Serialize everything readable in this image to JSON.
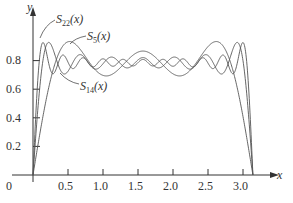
{
  "chart_data": {
    "type": "line",
    "title": "",
    "xlabel": "x",
    "ylabel": "y",
    "xlim": [
      0,
      3.3
    ],
    "ylim": [
      0,
      1.0
    ],
    "grid": false,
    "x_ticks": [
      0.5,
      1.0,
      1.5,
      2.0,
      2.5,
      3.0
    ],
    "x_tick_labels": [
      "0.5",
      "1.0",
      "1.5",
      "2.0",
      "2.5",
      "3.0"
    ],
    "y_ticks": [
      0.2,
      0.4,
      0.6,
      0.8
    ],
    "y_tick_labels": [
      "0.2",
      "0.4",
      "0.6",
      "0.8"
    ],
    "origin_label": "0",
    "function_description": "Partial sums of the Fourier sine series of the constant pi/4 on (0, pi): S_n(x) = sum over odd k <= n of sin(kx)/k",
    "series": [
      {
        "name": "S22(x)",
        "label_main": "S",
        "label_sub": "22",
        "label_arg": "(x)",
        "n": 22
      },
      {
        "name": "S5(x)",
        "label_main": "S",
        "label_sub": "5",
        "label_arg": "(x)",
        "n": 5
      },
      {
        "name": "S14(x)",
        "label_main": "S",
        "label_sub": "14",
        "label_arg": "(x)",
        "n": 14
      }
    ],
    "limit_value": 0.785
  },
  "labels": {
    "x_axis": "x",
    "y_axis": "y",
    "origin": "0"
  },
  "colors": {
    "curve": "#555555",
    "axis": "#333333"
  }
}
